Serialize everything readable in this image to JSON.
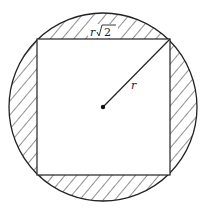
{
  "diagram": {
    "labels": {
      "radius": "r",
      "side_var": "r",
      "side_radicand": "2"
    },
    "shaded_region": "circle minus inscribed square",
    "colors": {
      "stroke": "#222222",
      "background": "#ffffff"
    }
  }
}
